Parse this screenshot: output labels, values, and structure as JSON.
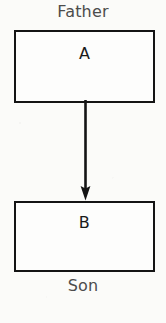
{
  "diagram": {
    "type": "block-diagram",
    "canvas": {
      "width": 166,
      "height": 323,
      "background": "#fbfbf9"
    },
    "top_caption": "Father",
    "bottom_caption": "Son",
    "caption_color": "#4c4c4c",
    "blocks": [
      {
        "id": "a",
        "label": "A",
        "role": "father",
        "border_color": "#141414",
        "fill_color": "#fdfdfc"
      },
      {
        "id": "b",
        "label": "B",
        "role": "son",
        "border_color": "#141414",
        "fill_color": "#fdfdfc"
      }
    ],
    "connectors": [
      {
        "id": "a-to-b",
        "from": "a",
        "to": "b",
        "direction": "down",
        "style": "solid-arrow",
        "color": "#141414"
      }
    ]
  }
}
